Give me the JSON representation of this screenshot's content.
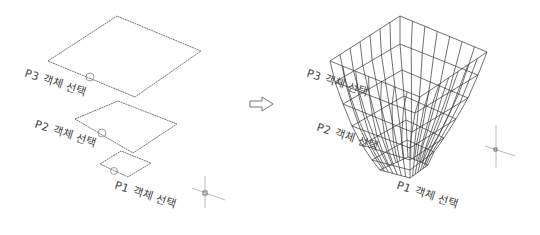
{
  "colors": {
    "line": "#555555",
    "mesh": "#333333",
    "text": "#444444",
    "crosshair": "#aaaaaa",
    "background": "#ffffff"
  },
  "left_panel": {
    "title": "Cross-section profiles",
    "profiles": [
      {
        "id": "P3",
        "label": "P3 객체 선택",
        "corners": [
          [
            48,
            61
          ],
          [
            117,
            16
          ],
          [
            201,
            51
          ],
          [
            135,
            97
          ]
        ],
        "marker": [
          90,
          77
        ]
      },
      {
        "id": "P2",
        "label": "P2 객체 선택",
        "corners": [
          [
            75,
            119
          ],
          [
            118,
            101
          ],
          [
            177,
            124
          ],
          [
            133,
            153
          ]
        ],
        "marker": [
          102,
          133
        ]
      },
      {
        "id": "P1",
        "label": "P1 객체 선택",
        "corners": [
          [
            100,
            164
          ],
          [
            121,
            151
          ],
          [
            151,
            163
          ],
          [
            128,
            177
          ]
        ],
        "marker": [
          114,
          171
        ]
      }
    ],
    "crosshair": [
      205,
      193
    ]
  },
  "arrow": {
    "icon": "right-arrow-icon",
    "glyph": "⇨"
  },
  "right_panel": {
    "title": "Lofted mesh result",
    "labels": [
      {
        "id": "P3",
        "label": "P3 객체 선택"
      },
      {
        "id": "P2",
        "label": "P2 객체 선택"
      },
      {
        "id": "P1",
        "label": "P1 객체 선택"
      }
    ],
    "crosshair": [
      496,
      150
    ]
  }
}
